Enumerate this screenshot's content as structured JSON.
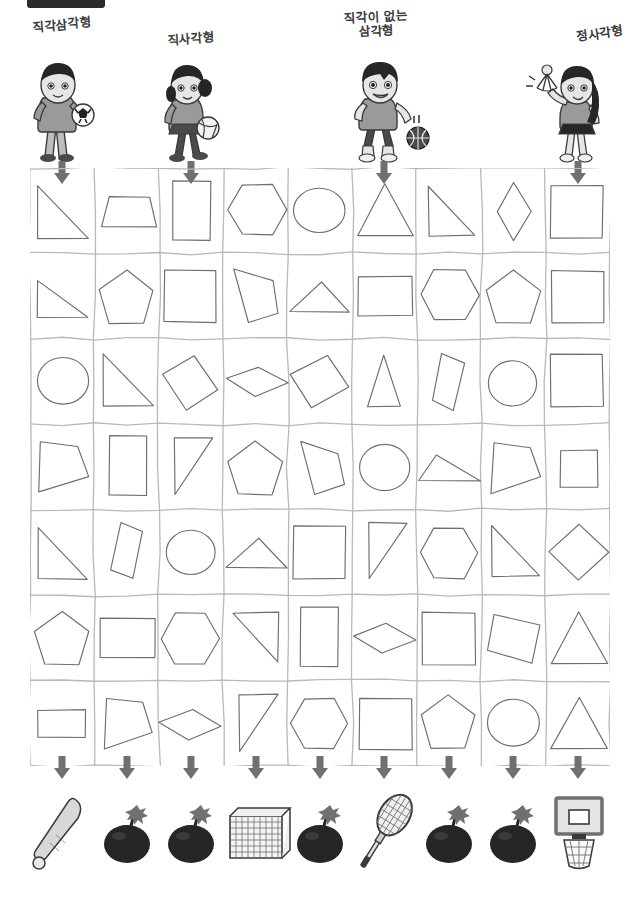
{
  "worksheet": {
    "title": "Shape sorting worksheet",
    "columns": 9,
    "rows": 7,
    "grid_stroke_color": "#b9b9b9",
    "shape_stroke_color": "#6e6e6e",
    "arrow_color": "#707070"
  },
  "top_bar": {
    "name": "cropped-black-banner",
    "color": "#2b2b2b"
  },
  "characters": [
    {
      "label": "직각삼각형",
      "icon": "boy-with-soccer-ball",
      "column": 1,
      "holds": "soccer-ball",
      "skin": "#e9e9e9",
      "hair": "#2b2b2b"
    },
    {
      "label": "직사각형",
      "icon": "girl-with-volleyball",
      "column": 3,
      "holds": "volleyball",
      "skin": "#e9e9e9",
      "hair": "#2b2b2b"
    },
    {
      "label": "직각이 없는\n삼각형",
      "icon": "boy-with-basketball",
      "column": 6,
      "holds": "basketball",
      "skin": "#e9e9e9",
      "hair": "#2b2b2b"
    },
    {
      "label": "정사각형",
      "icon": "girl-with-shuttlecock",
      "column": 9,
      "holds": "shuttlecock",
      "skin": "#e9e9e9",
      "hair": "#2b2b2b"
    }
  ],
  "arrows_top_columns": [
    1,
    3,
    6,
    9
  ],
  "arrows_bottom_columns": [
    1,
    2,
    3,
    4,
    5,
    6,
    7,
    8,
    9
  ],
  "equipment": [
    {
      "column": 1,
      "icon": "baseball-bat"
    },
    {
      "column": 2,
      "icon": "bomb"
    },
    {
      "column": 3,
      "icon": "bomb"
    },
    {
      "column": 4,
      "icon": "soccer-goal"
    },
    {
      "column": 5,
      "icon": "bomb"
    },
    {
      "column": 6,
      "icon": "badminton-racket"
    },
    {
      "column": 7,
      "icon": "bomb"
    },
    {
      "column": 8,
      "icon": "bomb"
    },
    {
      "column": 9,
      "icon": "basketball-hoop"
    }
  ],
  "grid_shapes": [
    [
      "right-triangle",
      "trapezoid",
      "rectangle-tall",
      "hexagon",
      "circle",
      "triangle-equilateral",
      "right-triangle-flipped",
      "diamond-tall",
      "square"
    ],
    [
      "right-triangle-small",
      "pentagon",
      "square",
      "quadrilateral-tilted",
      "flat-triangle",
      "rectangle-wide",
      "hexagon",
      "pentagon",
      "square"
    ],
    [
      "circle",
      "right-triangle",
      "diamond-rotated",
      "rhombus-flat",
      "diamond-rotated-large",
      "triangle-narrow",
      "rectangle-tilted",
      "circle",
      "square"
    ],
    [
      "quadrilateral-fan",
      "rectangle-tall",
      "right-triangle-thin",
      "pentagon",
      "quadrilateral-tilted",
      "circle",
      "flat-scalene-triangle",
      "quadrilateral-fan",
      "square-small"
    ],
    [
      "right-triangle",
      "rectangle-tilted",
      "circle",
      "flat-triangle",
      "square",
      "right-triangle-thin",
      "hexagon",
      "right-triangle-flipped",
      "diamond-large"
    ],
    [
      "pentagon",
      "rectangle-wide",
      "hexagon",
      "right-triangle-corner",
      "rectangle-tall",
      "rhombus-flat",
      "square",
      "square-tilted",
      "triangle-equilateral"
    ],
    [
      "rectangle-wide-small",
      "quadrilateral-fan",
      "rhombus-flat",
      "right-triangle-thin",
      "hexagon",
      "square",
      "pentagon",
      "circle",
      "triangle-equilateral"
    ]
  ]
}
